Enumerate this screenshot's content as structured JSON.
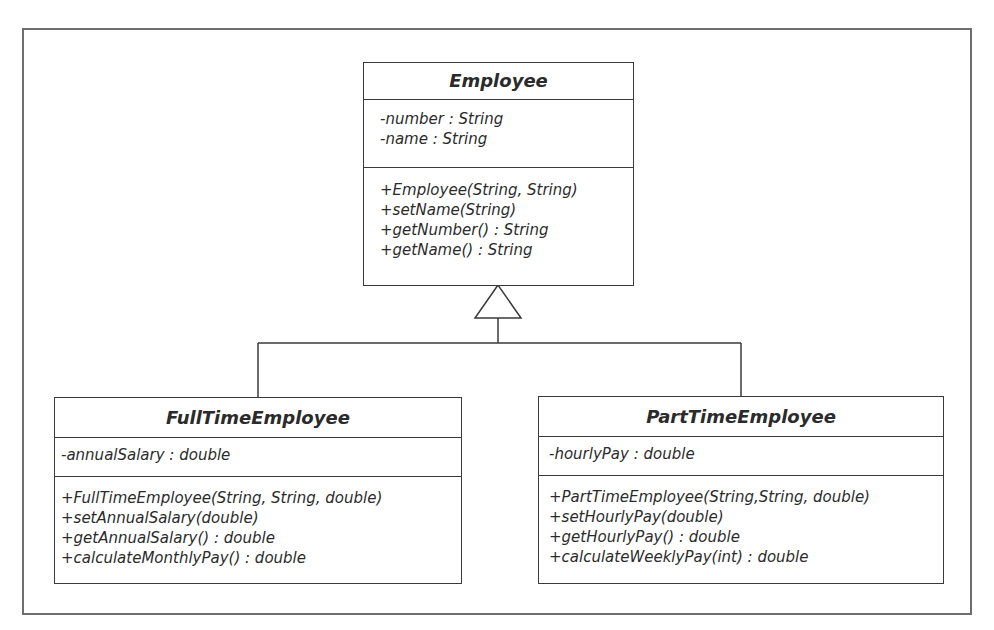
{
  "diagram": {
    "type": "UML class diagram",
    "classes": {
      "employee": {
        "name": "Employee",
        "attributes": [
          "-number : String",
          "-name : String"
        ],
        "operations": [
          "+Employee(String, String)",
          "+setName(String)",
          "+getNumber() : String",
          "+getName() : String"
        ]
      },
      "full_time": {
        "name": "FullTimeEmployee",
        "attributes": [
          "-annualSalary : double"
        ],
        "operations": [
          "+FullTimeEmployee(String, String, double)",
          "+setAnnualSalary(double)",
          "+getAnnualSalary() : double",
          "+calculateMonthlyPay() : double"
        ]
      },
      "part_time": {
        "name": "PartTimeEmployee",
        "attributes": [
          "-hourlyPay : double"
        ],
        "operations": [
          "+PartTimeEmployee(String,String, double)",
          "+setHourlyPay(double)",
          "+getHourlyPay() : double",
          "+calculateWeeklyPay(int) : double"
        ]
      }
    },
    "relationships": [
      {
        "type": "generalization",
        "from": "FullTimeEmployee",
        "to": "Employee"
      },
      {
        "type": "generalization",
        "from": "PartTimeEmployee",
        "to": "Employee"
      }
    ],
    "colors": {
      "line": "#3a3a3a",
      "frame": "#6e6e6e",
      "background": "#ffffff"
    }
  }
}
